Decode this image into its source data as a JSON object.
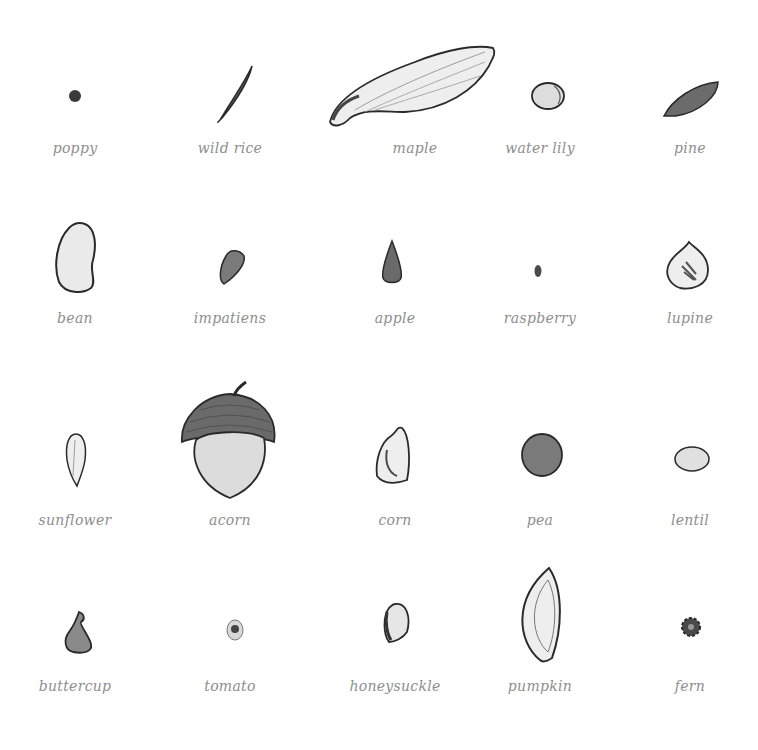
{
  "seeds": [
    {
      "name": "poppy"
    },
    {
      "name": "wild rice"
    },
    {
      "name": "maple"
    },
    {
      "name": "water lily"
    },
    {
      "name": "pine"
    },
    {
      "name": "bean"
    },
    {
      "name": "impatiens"
    },
    {
      "name": "apple"
    },
    {
      "name": "raspberry"
    },
    {
      "name": "lupine"
    },
    {
      "name": "sunflower"
    },
    {
      "name": "acorn"
    },
    {
      "name": "corn"
    },
    {
      "name": "pea"
    },
    {
      "name": "lentil"
    },
    {
      "name": "buttercup"
    },
    {
      "name": "tomato"
    },
    {
      "name": "honeysuckle"
    },
    {
      "name": "pumpkin"
    },
    {
      "name": "fern"
    }
  ],
  "colors": {
    "ink": "#333333",
    "fill_light": "#e8e8e8",
    "fill_mid": "#9a9a9a",
    "fill_dark": "#555555",
    "label": "#8e8e8e"
  }
}
